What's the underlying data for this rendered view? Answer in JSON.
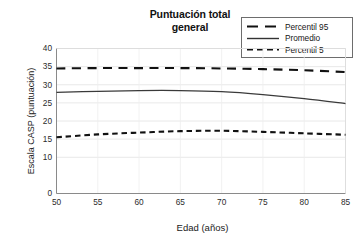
{
  "chart_data": {
    "type": "line",
    "title": "Puntuación total general",
    "title_lines": [
      "Puntuación total",
      "general"
    ],
    "xlabel": "Edad (años)",
    "ylabel": "Escala CASP (puntuación)",
    "xlim": [
      50,
      85
    ],
    "ylim": [
      0,
      40
    ],
    "xticks": [
      50,
      55,
      60,
      65,
      70,
      75,
      80,
      85
    ],
    "xtick_labels": [
      "50",
      "55",
      "60",
      "65",
      "70",
      "75",
      "80",
      "85"
    ],
    "yticks": [
      0,
      10,
      15,
      20,
      25,
      30,
      35,
      40
    ],
    "ytick_labels": [
      "0",
      "10",
      "15",
      "20",
      "25",
      "30",
      "35",
      "40"
    ],
    "grid": "horizontal-and-vertical-light",
    "legend_position": "top-right",
    "x": [
      50,
      55,
      60,
      65,
      70,
      75,
      80,
      85
    ],
    "series": [
      {
        "name": "Percentil 95",
        "style": "long-dash",
        "color": "#111111",
        "width": 2.1,
        "values": [
          34.5,
          34.6,
          34.6,
          34.6,
          34.5,
          34.3,
          34.0,
          33.5
        ]
      },
      {
        "name": "Promedio",
        "style": "solid",
        "color": "#3a3a3a",
        "width": 1.2,
        "values": [
          27.9,
          28.2,
          28.4,
          28.4,
          28.1,
          27.3,
          26.2,
          24.8
        ]
      },
      {
        "name": "Percentil 5",
        "style": "short-dash",
        "color": "#111111",
        "width": 2.1,
        "values": [
          15.5,
          16.3,
          16.8,
          17.2,
          17.3,
          17.0,
          16.6,
          16.2
        ]
      }
    ]
  },
  "legend": {
    "items": [
      {
        "label": "Percentil 95",
        "style": "long-dash"
      },
      {
        "label": "Promedio",
        "style": "solid"
      },
      {
        "label": "Percentil 5",
        "style": "short-dash"
      }
    ]
  }
}
